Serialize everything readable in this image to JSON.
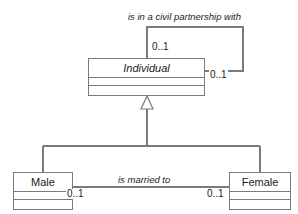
{
  "diagram": {
    "kind": "uml-class-diagram",
    "width": 298,
    "height": 214,
    "background_color": "#ffffff",
    "line_color": "#7a7a7a",
    "text_color": "#1a1a1a"
  },
  "classes": {
    "individual": {
      "name": "Individual",
      "abstract": true,
      "compartments": [
        "attributes",
        "operations"
      ]
    },
    "male": {
      "name": "Male",
      "abstract": false,
      "compartments": [
        "attributes",
        "operations"
      ]
    },
    "female": {
      "name": "Female",
      "abstract": false,
      "compartments": [
        "attributes",
        "operations"
      ]
    }
  },
  "associations": {
    "civil_partnership": {
      "label": "is in a civil partnership with",
      "kind": "self-association",
      "source_multiplicity": "0..1",
      "target_multiplicity": "0..1"
    },
    "marriage": {
      "label": "is married to",
      "kind": "association",
      "source_multiplicity": "0..1",
      "target_multiplicity": "0..1"
    }
  },
  "generalizations": {
    "male_to_individual": {
      "arrow": "hollow-triangle"
    },
    "female_to_individual": {
      "arrow": "hollow-triangle"
    }
  }
}
